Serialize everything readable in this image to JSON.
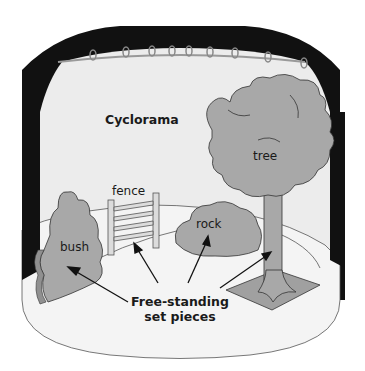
{
  "diagram": {
    "title": "Cyclorama",
    "labels": {
      "tree": "tree",
      "fence": "fence",
      "rock": "rock",
      "bush": "bush"
    },
    "caption_line1": "Free-standing",
    "caption_line2": "set pieces",
    "colors": {
      "background": "#ffffff",
      "masking": "#111111",
      "cyclorama": "#ececec",
      "floor": "#f3f3f3",
      "set_piece": "#a8a8a8",
      "outline": "#333333",
      "pipe": "#b8b8b8"
    }
  }
}
